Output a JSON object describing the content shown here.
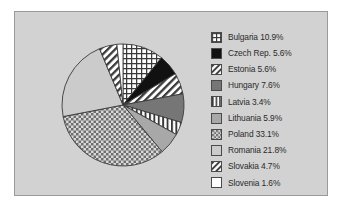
{
  "chart_data": {
    "type": "pie",
    "title": "",
    "subtitle": "",
    "xlabel": "",
    "ylabel": "",
    "grid": false,
    "legend_position": "right",
    "start_angle_deg": 0,
    "direction": "clockwise",
    "categories": [
      "Bulgaria",
      "Czech Rep.",
      "Estonia",
      "Hungary",
      "Latvia",
      "Lithuania",
      "Poland",
      "Romania",
      "Slovakia",
      "Slovenia"
    ],
    "values": [
      10.9,
      5.6,
      5.6,
      7.6,
      3.4,
      5.9,
      33.1,
      21.8,
      4.7,
      1.6
    ],
    "value_unit": "%",
    "slices": [
      {
        "label": "Bulgaria",
        "value": 10.9,
        "label_text": "Bulgaria 10.9%",
        "pattern": "grid",
        "fill": "#ffffff",
        "ink": "#3a3a3a"
      },
      {
        "label": "Czech Rep.",
        "value": 5.6,
        "label_text": "Czech Rep. 5.6%",
        "pattern": "solid",
        "fill": "#111111",
        "ink": "#111111"
      },
      {
        "label": "Estonia",
        "value": 5.6,
        "label_text": "Estonia 5.6%",
        "pattern": "diagonal-bw",
        "fill": "#ffffff",
        "ink": "#3a3a3a"
      },
      {
        "label": "Hungary",
        "value": 7.6,
        "label_text": "Hungary 7.6%",
        "pattern": "solid",
        "fill": "#767676",
        "ink": "#767676"
      },
      {
        "label": "Latvia",
        "value": 3.4,
        "label_text": "Latvia 3.4%",
        "pattern": "vertical",
        "fill": "#ffffff",
        "ink": "#3a3a3a"
      },
      {
        "label": "Lithuania",
        "value": 5.9,
        "label_text": "Lithuania 5.9%",
        "pattern": "solid",
        "fill": "#a8a8a8",
        "ink": "#a8a8a8"
      },
      {
        "label": "Poland",
        "value": 33.1,
        "label_text": "Poland 33.1%",
        "pattern": "checker",
        "fill": "#bfbfbf",
        "ink": "#555555"
      },
      {
        "label": "Romania",
        "value": 21.8,
        "label_text": "Romania 21.8%",
        "pattern": "solid",
        "fill": "#cbcbcb",
        "ink": "#cbcbcb"
      },
      {
        "label": "Slovakia",
        "value": 4.7,
        "label_text": "Slovakia 4.7%",
        "pattern": "diagonal-bw",
        "fill": "#ffffff",
        "ink": "#3a3a3a"
      },
      {
        "label": "Slovenia",
        "value": 1.6,
        "label_text": "Slovenia 1.6%",
        "pattern": "solid",
        "fill": "#ffffff",
        "ink": "#ffffff"
      }
    ]
  },
  "legend": {
    "items": [
      {
        "label": "Bulgaria 10.9%"
      },
      {
        "label": "Czech Rep. 5.6%"
      },
      {
        "label": "Estonia 5.6%"
      },
      {
        "label": "Hungary 7.6%"
      },
      {
        "label": "Latvia 3.4%"
      },
      {
        "label": "Lithuania 5.9%"
      },
      {
        "label": "Poland 33.1%"
      },
      {
        "label": "Romania 21.8%"
      },
      {
        "label": "Slovakia 4.7%"
      },
      {
        "label": "Slovenia 1.6%"
      }
    ]
  },
  "colors": {
    "panel_background": "#d2d2d2",
    "panel_border": "#9a9a9a",
    "figure_background": "#ffffff",
    "outline": "#3a3a3a",
    "text": "#2a2a2a"
  }
}
